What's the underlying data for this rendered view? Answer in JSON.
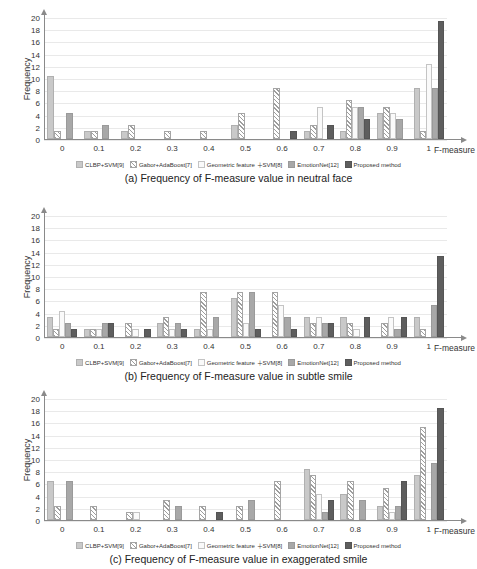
{
  "header_text": "",
  "axis": {
    "y_label": "Frequency",
    "y_ticks": [
      0,
      2,
      4,
      6,
      8,
      10,
      12,
      14,
      16,
      18,
      20
    ],
    "x_label": "F-measure",
    "x_ticks": [
      "0",
      "0.1",
      "0.2",
      "0.3",
      "0.4",
      "0.5",
      "0.6",
      "0.7",
      "0.8",
      "0.9",
      "1"
    ]
  },
  "legend": [
    {
      "label": "CLBP+SVM[9]",
      "swatch": "dotted-gray"
    },
    {
      "label": "Gabor+AdaBoost[7]",
      "swatch": "diagonal-hatch"
    },
    {
      "label": "Geometric feature ＋SVM[8]",
      "swatch": "white"
    },
    {
      "label": "EmotionNet[12]",
      "swatch": "mid-gray"
    },
    {
      "label": "Proposed method",
      "swatch": "dark-gray"
    }
  ],
  "colors": {
    "series1": "#c9c9c9",
    "series2": "#ffffff",
    "series3": "#fafafa",
    "series4": "#a8a8a8",
    "series5": "#5e5e5e",
    "axis": "#8a8a8a",
    "grid": "#e9e9e9"
  },
  "captions": {
    "a": "(a) Frequency of F-measure value in neutral face",
    "b": "(b) Frequency of F-measure value in subtle smile",
    "c": "(c) Frequency of F-measure value in exaggerated smile"
  },
  "chart_data": [
    {
      "id": "a",
      "type": "bar",
      "title": "(a) Frequency of F-measure value in neutral face",
      "xlabel": "F-measure",
      "ylabel": "Frequency",
      "ylim": [
        0,
        20
      ],
      "ytick_step": 2,
      "grid": true,
      "legend_position": "bottom",
      "categories": [
        "0",
        "0.1",
        "0.2",
        "0.3",
        "0.4",
        "0.5",
        "0.6",
        "0.7",
        "0.8",
        "0.9",
        "1"
      ],
      "series": [
        {
          "name": "CLBP+SVM[9]",
          "values": [
            10,
            1,
            1,
            0,
            0,
            2,
            0,
            1,
            1,
            4,
            8
          ]
        },
        {
          "name": "Gabor+AdaBoost[7]",
          "values": [
            1,
            1,
            2,
            1,
            1,
            4,
            8,
            2,
            6,
            5,
            1
          ]
        },
        {
          "name": "Geometric feature ＋SVM[8]",
          "values": [
            0,
            0,
            0,
            0,
            0,
            0,
            0,
            5,
            5,
            4,
            12
          ]
        },
        {
          "name": "EmotionNet[12]",
          "values": [
            4,
            2,
            0,
            0,
            0,
            0,
            0,
            0,
            5,
            3,
            8
          ]
        },
        {
          "name": "Proposed method",
          "values": [
            0,
            0,
            0,
            0,
            0,
            0,
            1,
            2,
            3,
            0,
            19
          ]
        }
      ]
    },
    {
      "id": "b",
      "type": "bar",
      "title": "(b) Frequency of F-measure value in subtle smile",
      "xlabel": "F-measure",
      "ylabel": "Frequency",
      "ylim": [
        0,
        20
      ],
      "ytick_step": 2,
      "grid": true,
      "legend_position": "bottom",
      "categories": [
        "0",
        "0.1",
        "0.2",
        "0.3",
        "0.4",
        "0.5",
        "0.6",
        "0.7",
        "0.8",
        "0.9",
        "1"
      ],
      "series": [
        {
          "name": "CLBP+SVM[9]",
          "values": [
            3,
            1,
            0,
            2,
            1,
            6,
            0,
            3,
            3,
            0,
            3
          ]
        },
        {
          "name": "Gabor+AdaBoost[7]",
          "values": [
            1,
            1,
            2,
            3,
            7,
            7,
            7,
            2,
            2,
            2,
            1
          ]
        },
        {
          "name": "Geometric feature ＋SVM[8]",
          "values": [
            4,
            1,
            1,
            1,
            1,
            2,
            5,
            3,
            1,
            3,
            0
          ]
        },
        {
          "name": "EmotionNet[12]",
          "values": [
            2,
            2,
            0,
            2,
            3,
            7,
            3,
            2,
            0,
            1,
            5
          ]
        },
        {
          "name": "Proposed method",
          "values": [
            1,
            2,
            1,
            1,
            0,
            1,
            1,
            2,
            3,
            3,
            13
          ]
        }
      ]
    },
    {
      "id": "c",
      "type": "bar",
      "title": "(c) Frequency of F-measure value in exaggerated smile",
      "xlabel": "F-measure",
      "ylabel": "Frequency",
      "ylim": [
        0,
        20
      ],
      "ytick_step": 2,
      "grid": true,
      "legend_position": "bottom",
      "categories": [
        "0",
        "0.1",
        "0.2",
        "0.3",
        "0.4",
        "0.5",
        "0.6",
        "0.7",
        "0.8",
        "0.9",
        "1"
      ],
      "series": [
        {
          "name": "CLBP+SVM[9]",
          "values": [
            6,
            0,
            0,
            0,
            0,
            0,
            0,
            8,
            4,
            2,
            7
          ]
        },
        {
          "name": "Gabor+AdaBoost[7]",
          "values": [
            2,
            2,
            1,
            3,
            2,
            2,
            6,
            7,
            6,
            5,
            15
          ]
        },
        {
          "name": "Geometric feature ＋SVM[8]",
          "values": [
            0,
            0,
            1,
            0,
            0,
            0,
            0,
            4,
            0,
            1,
            0
          ]
        },
        {
          "name": "EmotionNet[12]",
          "values": [
            6,
            0,
            0,
            2,
            0,
            3,
            0,
            1,
            3,
            2,
            9
          ]
        },
        {
          "name": "Proposed method",
          "values": [
            0,
            0,
            0,
            0,
            1,
            0,
            0,
            3,
            0,
            6,
            18
          ]
        }
      ]
    }
  ]
}
